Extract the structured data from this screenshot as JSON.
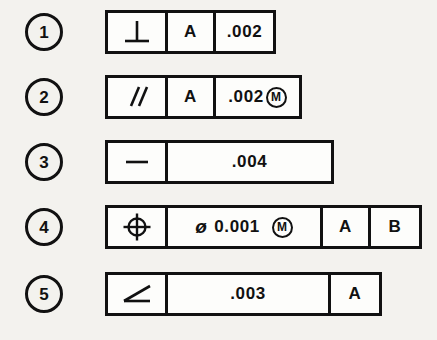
{
  "figure": {
    "background_color": "#f3f2ee",
    "line_color": "#111111",
    "frame_fill": "#fdfdfb"
  },
  "rows": [
    {
      "index": "1",
      "symbol_name": "perpendicularity-symbol",
      "symbol_label": "perpendicularity",
      "cells": [
        {
          "kind": "symbol",
          "value": "perpendicularity"
        },
        {
          "kind": "datum",
          "value": "A"
        },
        {
          "kind": "tolerance",
          "value": ".002",
          "diameter": "",
          "modifier": ""
        }
      ]
    },
    {
      "index": "2",
      "symbol_name": "parallelism-symbol",
      "symbol_label": "parallelism",
      "cells": [
        {
          "kind": "symbol",
          "value": "parallelism"
        },
        {
          "kind": "datum",
          "value": "A"
        },
        {
          "kind": "tolerance",
          "value": ".002",
          "diameter": "",
          "modifier": "M"
        }
      ]
    },
    {
      "index": "3",
      "symbol_name": "straightness-symbol",
      "symbol_label": "straightness",
      "cells": [
        {
          "kind": "symbol",
          "value": "straightness"
        },
        {
          "kind": "tolerance",
          "value": ".004",
          "diameter": "",
          "modifier": ""
        }
      ]
    },
    {
      "index": "4",
      "symbol_name": "position-symbol",
      "symbol_label": "position",
      "cells": [
        {
          "kind": "symbol",
          "value": "position"
        },
        {
          "kind": "tolerance",
          "value": "0.001",
          "diameter": "ø",
          "modifier": "M"
        },
        {
          "kind": "datum",
          "value": "A"
        },
        {
          "kind": "datum",
          "value": "B"
        }
      ]
    },
    {
      "index": "5",
      "symbol_name": "angularity-symbol",
      "symbol_label": "angularity",
      "cells": [
        {
          "kind": "symbol",
          "value": "angularity"
        },
        {
          "kind": "tolerance",
          "value": ".003",
          "diameter": "",
          "modifier": ""
        },
        {
          "kind": "datum",
          "value": "A"
        }
      ]
    }
  ]
}
